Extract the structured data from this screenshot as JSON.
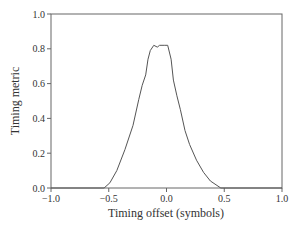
{
  "chart_data": {
    "type": "line",
    "title": "",
    "xlabel": "Timing offset (symbols)",
    "ylabel": "Timing metric",
    "xlim": [
      -1.0,
      1.0
    ],
    "ylim": [
      0.0,
      1.0
    ],
    "xticks": [
      -1.0,
      -0.5,
      0.0,
      0.5,
      1.0
    ],
    "xtick_labels": [
      "−1.0",
      "−0.5",
      "0.0",
      "0.5",
      "1.0"
    ],
    "yticks": [
      0.0,
      0.2,
      0.4,
      0.6,
      0.8,
      1.0
    ],
    "ytick_labels": [
      "0.0",
      "0.2",
      "0.4",
      "0.6",
      "0.8",
      "1.0"
    ],
    "grid": false,
    "legend": null,
    "series": [
      {
        "name": "Timing metric",
        "color": "#555555",
        "x": [
          -1.0,
          -0.54,
          -0.49,
          -0.43,
          -0.36,
          -0.29,
          -0.24,
          -0.21,
          -0.18,
          -0.16,
          -0.14,
          -0.11,
          -0.08,
          -0.06,
          -0.02,
          0.01,
          0.04,
          0.06,
          0.09,
          0.12,
          0.16,
          0.2,
          0.26,
          0.32,
          0.38,
          0.47,
          1.0
        ],
        "y": [
          0.0,
          0.0,
          0.03,
          0.1,
          0.22,
          0.36,
          0.51,
          0.59,
          0.65,
          0.74,
          0.79,
          0.82,
          0.81,
          0.82,
          0.82,
          0.82,
          0.74,
          0.62,
          0.53,
          0.45,
          0.33,
          0.25,
          0.16,
          0.09,
          0.04,
          0.0,
          0.0
        ]
      }
    ]
  }
}
